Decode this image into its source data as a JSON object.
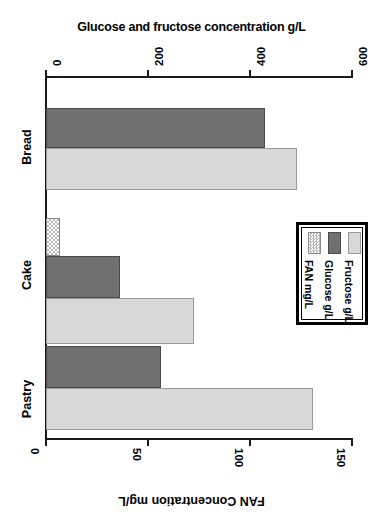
{
  "chart_data": {
    "type": "bar",
    "orientation": "horizontal",
    "title": "",
    "categories": [
      "Bread",
      "Cake",
      "Pastry"
    ],
    "series": [
      {
        "name": "Fructose g/L",
        "axis": "top",
        "values": [
          492,
          290,
          523
        ],
        "color": "#d8d8d8"
      },
      {
        "name": "Glucose g/L",
        "axis": "top",
        "values": [
          430,
          145,
          225
        ],
        "color": "#707070"
      },
      {
        "name": "FAN mg/L",
        "axis": "bottom",
        "values": [
          0,
          7,
          0
        ],
        "color": "#b9b9b9"
      }
    ],
    "top_axis": {
      "label": "Glucose and fructose concentration g/L",
      "ticks": [
        0,
        200,
        400,
        600
      ],
      "lim": [
        0,
        600
      ]
    },
    "bottom_axis": {
      "label": "FAN Concentration mg/L",
      "ticks": [
        0,
        50,
        100,
        150
      ],
      "lim": [
        0,
        150
      ]
    },
    "legend": {
      "position": "middle-right",
      "entries": [
        "Fructose g/L",
        "Glucose g/L",
        "FAN mg/L"
      ]
    },
    "grid": false
  },
  "axes": {
    "top_title": "Glucose and fructose concentration g/L",
    "bottom_title": "FAN Concentration mg/L",
    "top_ticklabels": [
      "0",
      "200",
      "400",
      "600"
    ],
    "bottom_ticklabels": [
      "0",
      "50",
      "100",
      "150"
    ]
  },
  "categories": [
    {
      "label": "Bread"
    },
    {
      "label": "Cake"
    },
    {
      "label": "Pastry"
    }
  ],
  "legend": {
    "entries": [
      {
        "label": "Fructose g/L",
        "swatch": "light-gray-swatch"
      },
      {
        "label": "Glucose g/L",
        "swatch": "dark-gray-swatch"
      },
      {
        "label": "FAN mg/L",
        "swatch": "dotted-swatch"
      }
    ]
  }
}
